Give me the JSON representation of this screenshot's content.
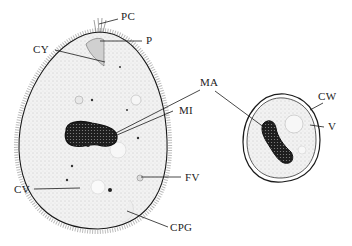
{
  "diagram": {
    "colors": {
      "ink": "#1a1a1a",
      "stipple": "#d8d8d8",
      "nucleus": "#1e1e1e",
      "background": "#ffffff"
    },
    "labels": {
      "pc": "PC",
      "p": "P",
      "cy": "CY",
      "ma": "MA",
      "mi": "MI",
      "cv": "CV",
      "fv": "FV",
      "cpg": "CPG",
      "cw": "CW",
      "v": "V"
    }
  }
}
